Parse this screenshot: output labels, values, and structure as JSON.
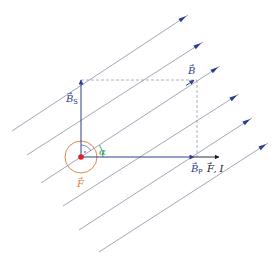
{
  "diagram": {
    "colors": {
      "field_line": "#8a8fa8",
      "vector": "#2c3e8c",
      "dashed": "#9aa0b4",
      "force": "#e07a3a",
      "dot": "#e31e24",
      "angle": "#3a9a5a"
    },
    "labels": {
      "b": "B",
      "bs": "B",
      "bs_sub": "S",
      "bp": "B",
      "bp_sub": "P",
      "fl": "F",
      "fl_sub": "",
      "current": "I",
      "force": "F",
      "alpha": "α"
    },
    "field_lines": [
      {
        "x1": 12,
        "y1": 131,
        "x2": 188,
        "y2": 15
      },
      {
        "x1": 27,
        "y1": 155,
        "x2": 203,
        "y2": 42
      },
      {
        "x1": 41,
        "y1": 183,
        "x2": 220,
        "y2": 66
      },
      {
        "x1": 63,
        "y1": 206,
        "x2": 239,
        "y2": 94
      },
      {
        "x1": 79,
        "y1": 230,
        "x2": 252,
        "y2": 118
      },
      {
        "x1": 99,
        "y1": 252,
        "x2": 268,
        "y2": 143
      }
    ]
  }
}
